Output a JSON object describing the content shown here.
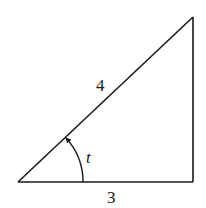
{
  "diagram": {
    "type": "right-triangle",
    "hypotenuse_label": "4",
    "base_label": "3",
    "angle_label": "t",
    "colors": {
      "stroke": "#1a1a1a",
      "background": "#ffffff"
    }
  }
}
